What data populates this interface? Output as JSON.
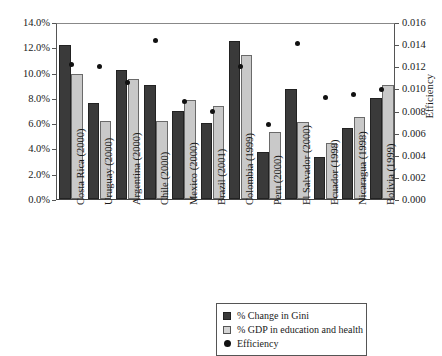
{
  "chart_data": {
    "type": "bar",
    "title": "",
    "xlabel": "",
    "ylabel": "",
    "ylabel_right": "Efficiency",
    "grid": false,
    "legend_position": "bottom-right",
    "ylim": [
      0,
      14
    ],
    "ylim_right": [
      0,
      0.016
    ],
    "y_ticks": [
      "0.0%",
      "2.0%",
      "4.0%",
      "6.0%",
      "8.0%",
      "10.0%",
      "12.0%",
      "14.0%"
    ],
    "y_ticks_right": [
      "0.000",
      "0.002",
      "0.004",
      "0.006",
      "0.008",
      "0.010",
      "0.012",
      "0.014",
      "0.016"
    ],
    "categories": [
      "Costa Rica (2000)",
      "Uruguay (2000)",
      "Argentina (2000)",
      "Chile (2000)",
      "Mexico (2000)",
      "Brazil (2001)",
      "Colombia (1999)",
      "Peru (2000)",
      "El Salvador (2000)",
      "Ecuador (1998)",
      "Nicaragua (1998)",
      "Bolivia (1999)"
    ],
    "series": [
      {
        "name": "% Change in Gini",
        "type": "bar",
        "axis": "left",
        "color": "#3a3a3a",
        "values": [
          12.2,
          7.6,
          10.2,
          9.05,
          7.0,
          6.0,
          12.5,
          3.75,
          8.7,
          3.3,
          5.6,
          8.0
        ]
      },
      {
        "name": "% GDP in education and health",
        "type": "bar",
        "axis": "left",
        "color": "#c9c9c9",
        "values": [
          9.9,
          6.2,
          9.5,
          6.2,
          7.8,
          7.35,
          11.4,
          5.3,
          6.1,
          4.45,
          6.5,
          9.0
        ]
      },
      {
        "name": "Efficiency",
        "type": "scatter",
        "axis": "right",
        "color": "#111111",
        "values": [
          0.0123,
          0.0122,
          0.0107,
          0.0145,
          0.009,
          0.0081,
          0.0122,
          0.0069,
          0.0142,
          0.0094,
          0.0096,
          0.0101
        ]
      }
    ]
  },
  "legend": {
    "items": [
      {
        "label": "% Change in Gini",
        "swatch": "dark-square"
      },
      {
        "label": "% GDP in education and health",
        "swatch": "light-square"
      },
      {
        "label": "Efficiency",
        "swatch": "black-dot"
      }
    ]
  }
}
